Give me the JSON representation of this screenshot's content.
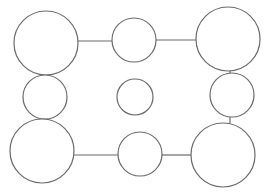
{
  "diagram": {
    "width": 267,
    "height": 195,
    "background": "#ffffff",
    "stroke_color": "#6b6b6b",
    "stroke_width": 1.2,
    "nodes": [
      {
        "id": "top-left",
        "cx": 46,
        "cy": 43,
        "r": 32
      },
      {
        "id": "top-middle",
        "cx": 134,
        "cy": 40,
        "r": 22
      },
      {
        "id": "top-right",
        "cx": 228,
        "cy": 39,
        "r": 32
      },
      {
        "id": "middle-left",
        "cx": 45,
        "cy": 97,
        "r": 22
      },
      {
        "id": "center",
        "cx": 135,
        "cy": 97,
        "r": 18
      },
      {
        "id": "middle-right",
        "cx": 232,
        "cy": 95,
        "r": 22
      },
      {
        "id": "bottom-left",
        "cx": 42,
        "cy": 151,
        "r": 32
      },
      {
        "id": "bottom-middle",
        "cx": 140,
        "cy": 154,
        "r": 22
      },
      {
        "id": "bottom-right",
        "cx": 223,
        "cy": 155,
        "r": 32
      }
    ],
    "edges": [
      {
        "from": "top-left",
        "to": "top-middle",
        "x1": 78,
        "y1": 41,
        "x2": 112,
        "y2": 41
      },
      {
        "from": "top-middle",
        "to": "top-right",
        "x1": 156,
        "y1": 40,
        "x2": 196,
        "y2": 40
      },
      {
        "from": "top-right",
        "to": "middle-right",
        "x1": 230,
        "y1": 71,
        "x2": 230,
        "y2": 73
      },
      {
        "from": "middle-right",
        "to": "bottom-right",
        "x1": 230,
        "y1": 117,
        "x2": 230,
        "y2": 123
      },
      {
        "from": "bottom-left",
        "to": "bottom-middle",
        "x1": 74,
        "y1": 155,
        "x2": 118,
        "y2": 155
      },
      {
        "from": "bottom-middle",
        "to": "bottom-right",
        "x1": 162,
        "y1": 155,
        "x2": 191,
        "y2": 155
      }
    ]
  }
}
